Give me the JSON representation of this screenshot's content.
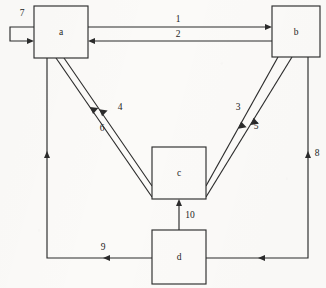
{
  "diagram": {
    "type": "directed-graph",
    "background_color": "#fbfaf8",
    "line_color": "#2b2b2b",
    "nodes": [
      {
        "id": "a",
        "label": "a",
        "x": 34,
        "y": 6,
        "w": 54,
        "h": 52
      },
      {
        "id": "b",
        "label": "b",
        "x": 272,
        "y": 6,
        "w": 48,
        "h": 51
      },
      {
        "id": "c",
        "label": "c",
        "x": 152,
        "y": 147,
        "w": 54,
        "h": 52
      },
      {
        "id": "d",
        "label": "d",
        "x": 152,
        "y": 230,
        "w": 54,
        "h": 54
      }
    ],
    "edges": [
      {
        "label": "1",
        "from": "a",
        "to": "b",
        "label_x": 178,
        "label_y": 20
      },
      {
        "label": "2",
        "from": "b",
        "to": "a",
        "label_x": 178,
        "label_y": 35
      },
      {
        "label": "3",
        "from": "b",
        "to": "c",
        "label_x": 238,
        "label_y": 108
      },
      {
        "label": "4",
        "from": "c",
        "to": "a",
        "label_x": 120,
        "label_y": 108
      },
      {
        "label": "5",
        "from": "b",
        "to": "c",
        "label_x": 256,
        "label_y": 127
      },
      {
        "label": "6",
        "from": "c",
        "to": "a",
        "label_x": 102,
        "label_y": 129
      },
      {
        "label": "7",
        "from": "a",
        "to": "a",
        "label_x": 22,
        "label_y": 14
      },
      {
        "label": "8",
        "from": "d",
        "to": "b",
        "label_x": 317,
        "label_y": 154
      },
      {
        "label": "9",
        "from": "d",
        "to": "a",
        "label_x": 103,
        "label_y": 248
      },
      {
        "label": "10",
        "from": "d",
        "to": "c",
        "label_x": 190,
        "label_y": 216
      }
    ]
  }
}
